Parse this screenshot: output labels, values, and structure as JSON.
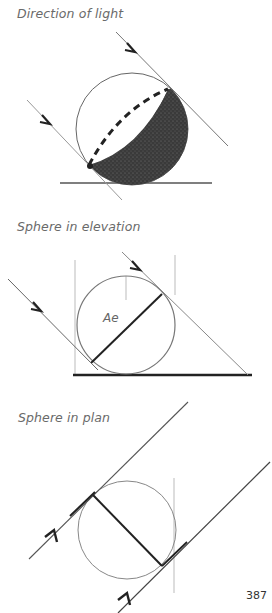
{
  "figures": [
    {
      "id": "direction-of-light",
      "caption": "Direction of light"
    },
    {
      "id": "sphere-in-elevation",
      "caption": "Sphere in elevation",
      "label": "Ae"
    },
    {
      "id": "sphere-in-plan",
      "caption": "Sphere in plan"
    }
  ],
  "page_number": "387",
  "colors": {
    "line": "#444444",
    "shadow": "#2a2a2a",
    "caption": "#6a6a6a"
  }
}
